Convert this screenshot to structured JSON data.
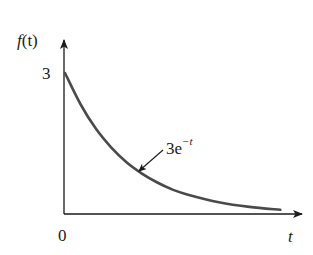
{
  "chart_data": {
    "type": "line",
    "title": "",
    "xlabel": "t",
    "ylabel": "f(t)",
    "x_tick_labels": [
      "0"
    ],
    "y_tick_labels": [
      "3"
    ],
    "xlim": [
      0,
      3.9
    ],
    "ylim": [
      0,
      3.0
    ],
    "grid": false,
    "legend": null,
    "function": "3e^{-t}",
    "series": [
      {
        "name": "3e^-t",
        "x": [
          0,
          0.25,
          0.5,
          0.75,
          1.0,
          1.25,
          1.5,
          1.75,
          2.0,
          2.5,
          3.0,
          3.5
        ],
        "values": [
          3.0,
          2.34,
          1.82,
          1.42,
          1.1,
          0.86,
          0.67,
          0.52,
          0.41,
          0.25,
          0.15,
          0.09
        ]
      }
    ],
    "annotations": [
      {
        "text_base": "3e",
        "text_exp": "−t",
        "points_to": "curve near t≈1.2"
      }
    ],
    "colors": {
      "curve": "#4a4a4a",
      "axes": "#1a1a1a"
    }
  },
  "labels": {
    "y_axis_f": "f",
    "y_axis_paren": "(t)",
    "y_tick_3": "3",
    "origin": "0",
    "x_axis": "t",
    "annotation_base": "3e",
    "annotation_exp": "−t"
  }
}
